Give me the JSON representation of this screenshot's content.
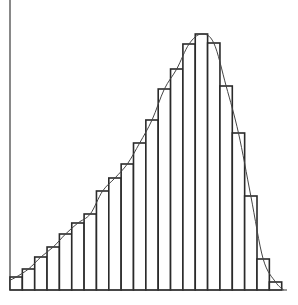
{
  "chart_data": {
    "type": "bar",
    "subtype": "histogram-with-density-curve",
    "title": "",
    "xlabel": "",
    "ylabel": "",
    "grid": false,
    "legend": null,
    "categories": [
      "1",
      "2",
      "3",
      "4",
      "5",
      "6",
      "7",
      "8",
      "9",
      "10",
      "11",
      "12",
      "13",
      "14",
      "15",
      "16",
      "17",
      "18",
      "19",
      "20",
      "21",
      "22"
    ],
    "values": [
      13,
      21,
      33,
      43,
      56,
      67,
      76,
      99,
      112,
      126,
      147,
      170,
      201,
      221,
      246,
      256,
      247,
      204,
      157,
      94,
      31,
      8
    ],
    "ylim": [
      0,
      260
    ],
    "overlay": {
      "type": "line",
      "name": "fitted density curve",
      "smooth": true,
      "left_skewed": true
    }
  },
  "layout": {
    "origin_x": 10,
    "baseline_y": 290,
    "bar_width": 12.35,
    "axis_top": 0,
    "axis_right": 287
  },
  "colors": {
    "stroke": "#2a2a2a",
    "fill": "#ffffff",
    "background": "#ffffff"
  }
}
